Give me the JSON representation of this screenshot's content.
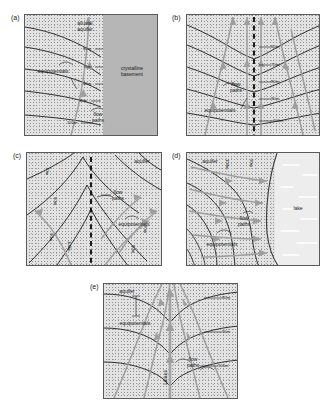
{
  "figure": {
    "type": "groundwater-flow-net-diagram",
    "background_color": "#ffffff",
    "aquifer_fill": "#e3e3e3",
    "basement_fill": "#b6b6b6",
    "lake_fill": "#ededed",
    "equipotential_color": "#1d1d1d",
    "flowpath_color": "#9e9e9e",
    "divide_color": "#111111"
  },
  "panels": [
    {
      "id": "a",
      "label": "(a)",
      "setting": "alluvial aquifer bounded by crystalline basement",
      "annotations": {
        "aquifer": "alluvial\naquifer",
        "aquifer_line1": "alluvial",
        "aquifer_line2": "aquifer",
        "basement_line1": "crystalline",
        "basement_line2": "basement",
        "equipotentials": "equipotentials",
        "flow_paths_line1": "flow",
        "flow_paths_line2": "paths"
      },
      "contours": [
        {
          "value": "60m"
        },
        {
          "value": "70m"
        },
        {
          "value": "80m"
        },
        {
          "value": "90m"
        },
        {
          "value": "100m"
        }
      ]
    },
    {
      "id": "b",
      "label": "(b)",
      "setting": "symmetric groundwater divide in aquifer",
      "annotations": {
        "equipotentials": "equipotentials",
        "flow_paths_line1": "flow",
        "flow_paths_line2": "paths"
      },
      "contours": [
        {
          "value": "60m"
        },
        {
          "value": "70m"
        },
        {
          "value": "80m"
        },
        {
          "value": "90m"
        },
        {
          "value": "100m"
        }
      ]
    },
    {
      "id": "c",
      "label": "(c)",
      "setting": "groundwater mound with diverging flow",
      "annotations": {
        "aquifer": "aquifer",
        "equipotentials": "equipotentials",
        "flow_paths_line1": "flow",
        "flow_paths_line2": "paths"
      },
      "contours": [
        {
          "value": "70m"
        },
        {
          "value": "80m"
        },
        {
          "value": "90m"
        },
        {
          "value": "100m"
        },
        {
          "value": "90m"
        },
        {
          "value": "80m"
        }
      ]
    },
    {
      "id": "d",
      "label": "(d)",
      "setting": "aquifer discharging to a lake",
      "annotations": {
        "aquifer": "aquifer",
        "lake": "lake",
        "equipotentials": "equipotentials",
        "flow_paths_line1": "flow",
        "flow_paths_line2": "paths"
      },
      "contours": [
        {
          "value": "100m"
        },
        {
          "value": "90m"
        }
      ]
    },
    {
      "id": "e",
      "label": "(e)",
      "setting": "aquifer converging on a gaining stream",
      "annotations": {
        "aquifer": "aquifer",
        "stream": "stream",
        "equipotentials": "equipotentials",
        "flow_paths_line1": "flow",
        "flow_paths_line2": "paths"
      },
      "contours": [
        {
          "value": "80m"
        },
        {
          "value": "90m"
        },
        {
          "value": "100m"
        }
      ]
    }
  ]
}
